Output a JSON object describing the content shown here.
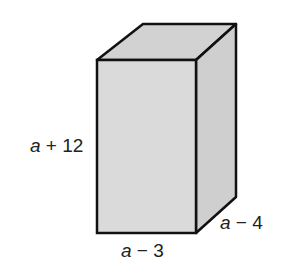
{
  "figure": {
    "type": "rectangular prism",
    "colors": {
      "front_face": "#dadada",
      "top_face": "#d2d2d2",
      "side_face": "#cfcfcf",
      "edge": "#111111",
      "label": "#222222",
      "background": "#ffffff"
    },
    "labels": {
      "height": {
        "variable": "a",
        "operator": "+",
        "constant": "12"
      },
      "width": {
        "variable": "a",
        "operator": "−",
        "constant": "3"
      },
      "depth": {
        "variable": "a",
        "operator": "−",
        "constant": "4"
      }
    }
  }
}
